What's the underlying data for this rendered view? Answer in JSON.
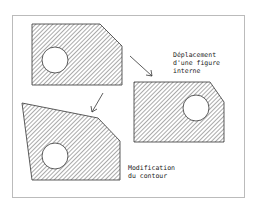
{
  "diagram": {
    "labels": {
      "move_internal": [
        "Déplacement",
        "d'une figure",
        "interne"
      ],
      "modify_contour": [
        "Modification",
        "du contour"
      ]
    },
    "shapes": [
      {
        "name": "original-part",
        "kind": "chamfered-plate-with-hole"
      },
      {
        "name": "moved-hole-part",
        "kind": "chamfered-plate-with-hole"
      },
      {
        "name": "modified-contour-part",
        "kind": "distorted-plate-with-hole"
      }
    ],
    "colors": {
      "stroke": "#333333",
      "hatch": "#555555",
      "frame": "#bbbbbb"
    }
  }
}
